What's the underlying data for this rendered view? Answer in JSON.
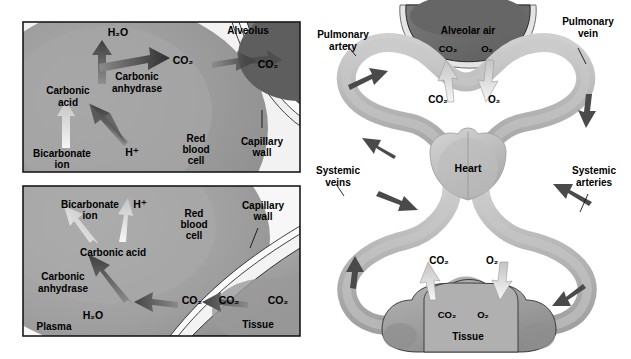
{
  "figure": {
    "title_visible": false,
    "panels": [
      "alveolar-gas-exchange-detail",
      "tissue-gas-exchange-detail",
      "circulatory-overview"
    ]
  },
  "colors": {
    "rbc_fill": "#9a9a9a",
    "rbc_fill_light": "#b9b9b9",
    "plasma_fill": "#ececec",
    "alveolus_fill": "#6d6d6d",
    "alveolus_fill_dark": "#5a5a5a",
    "capillary_wall_fill": "#f4f4f4",
    "tissue_fill": "#a2a2a2",
    "vessel_fill": "#b0b0b0",
    "vessel_fill_light": "#c6c6c6",
    "arrow_dark": "#3a3a3a",
    "arrow_light": "#efefef",
    "panel_border": "#1a1a1a",
    "text": "#000000",
    "background": "#ffffff"
  },
  "panel_top_left": {
    "name": "Alveolar gas exchange detail",
    "labels": {
      "water": "H₂O",
      "carbon_dioxide_in_cell": "CO₂",
      "carbon_dioxide_in_alveolus": "CO₂",
      "carbonic_anhydrase": "Carbonic\nanhydrase",
      "carbonic_anhydrase_line1": "Carbonic",
      "carbonic_anhydrase_line2": "anhydrase",
      "carbonic_acid_line1": "Carbonic",
      "carbonic_acid_line2": "acid",
      "bicarbonate_line1": "Bicarbonate",
      "bicarbonate_line2": "ion",
      "hydrogen_ion": "H⁺",
      "red_blood_cell_line1": "Red",
      "red_blood_cell_line2": "blood",
      "red_blood_cell_line3": "cell",
      "capillary_wall_line1": "Capillary",
      "capillary_wall_line2": "wall",
      "alveolus": "Alveolus"
    },
    "arrows": [
      {
        "name": "bicarbonate-to-carbonic-acid",
        "from": "Bicarbonate ion",
        "to": "Carbonic acid",
        "tone": "light"
      },
      {
        "name": "hydrogen-to-carbonic-acid",
        "from": "H⁺",
        "to": "Carbonic acid",
        "tone": "light"
      },
      {
        "name": "carbonic-acid-to-water",
        "from": "Carbonic acid",
        "to": "H₂O",
        "tone": "dark"
      },
      {
        "name": "carbonic-acid-to-co2",
        "from": "Carbonic acid",
        "to": "CO₂",
        "tone": "dark"
      },
      {
        "name": "co2-across-capillary-wall",
        "from": "Red blood cell CO₂",
        "to": "Alveolus CO₂",
        "tone": "dark"
      }
    ]
  },
  "panel_bottom_left": {
    "name": "Tissue gas exchange detail",
    "labels": {
      "bicarbonate_line1": "Bicarbonate",
      "bicarbonate_line2": "ion",
      "hydrogen_ion": "H⁺",
      "carbonic_acid": "Carbonic acid",
      "carbonic_anhydrase_line1": "Carbonic",
      "carbonic_anhydrase_line2": "anhydrase",
      "water": "H₂O",
      "carbon_dioxide_in_cell": "CO₂",
      "carbon_dioxide_in_plasma": "CO₂",
      "carbon_dioxide_in_tissue": "CO₂",
      "red_blood_cell_line1": "Red",
      "red_blood_cell_line2": "blood",
      "red_blood_cell_line3": "cell",
      "capillary_wall_line1": "Capillary",
      "capillary_wall_line2": "wall",
      "plasma": "Plasma",
      "tissue": "Tissue"
    },
    "arrows": [
      {
        "name": "carbonic-acid-to-bicarbonate",
        "from": "Carbonic acid",
        "to": "Bicarbonate ion",
        "tone": "light"
      },
      {
        "name": "carbonic-acid-to-hydrogen",
        "from": "Carbonic acid",
        "to": "H⁺",
        "tone": "light"
      },
      {
        "name": "co2-water-to-carbonic-acid",
        "from": "CO₂ + H₂O",
        "to": "Carbonic acid",
        "tone": "dark"
      },
      {
        "name": "co2-plasma-to-cell",
        "from": "CO₂ plasma",
        "to": "CO₂ cell",
        "tone": "dark"
      },
      {
        "name": "co2-tissue-to-plasma",
        "from": "CO₂ tissue",
        "to": "CO₂ plasma",
        "tone": "dark"
      }
    ]
  },
  "panel_right": {
    "name": "Circulatory overview",
    "labels": {
      "alveolar_air": "Alveolar air",
      "alveolar_co2": "CO₂",
      "alveolar_o2": "O₂",
      "blood_co2_pulmonary": "CO₂",
      "blood_o2_pulmonary": "O₂",
      "pulmonary_artery_line1": "Pulmonary",
      "pulmonary_artery_line2": "artery",
      "pulmonary_vein_line1": "Pulmonary",
      "pulmonary_vein_line2": "vein",
      "heart": "Heart",
      "systemic_veins_line1": "Systemic",
      "systemic_veins_line2": "veins",
      "systemic_arteries_line1": "Systemic",
      "systemic_arteries_line2": "arteries",
      "blood_co2_systemic": "CO₂",
      "blood_o2_systemic": "O₂",
      "tissue_co2": "CO₂",
      "tissue_o2": "O₂",
      "tissue": "Tissue"
    },
    "flow_arrows": [
      {
        "name": "pulmonary-artery-flow",
        "direction": "right-to-lung"
      },
      {
        "name": "pulmonary-vein-flow",
        "direction": "lung-to-heart"
      },
      {
        "name": "systemic-artery-flow",
        "direction": "heart-to-tissue"
      },
      {
        "name": "systemic-vein-flow",
        "direction": "tissue-to-heart"
      },
      {
        "name": "alveolar-co2-release",
        "direction": "blood-to-alveolus"
      },
      {
        "name": "alveolar-o2-uptake",
        "direction": "alveolus-to-blood"
      },
      {
        "name": "tissue-co2-uptake",
        "direction": "tissue-to-blood"
      },
      {
        "name": "tissue-o2-delivery",
        "direction": "blood-to-tissue"
      }
    ]
  }
}
